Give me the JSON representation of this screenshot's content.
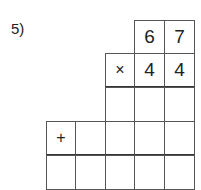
{
  "problem": {
    "label": "5)",
    "multiplicand": [
      "6",
      "7"
    ],
    "multiplier": [
      "4",
      "4"
    ],
    "times_sign": "×",
    "plus_sign": "+"
  }
}
